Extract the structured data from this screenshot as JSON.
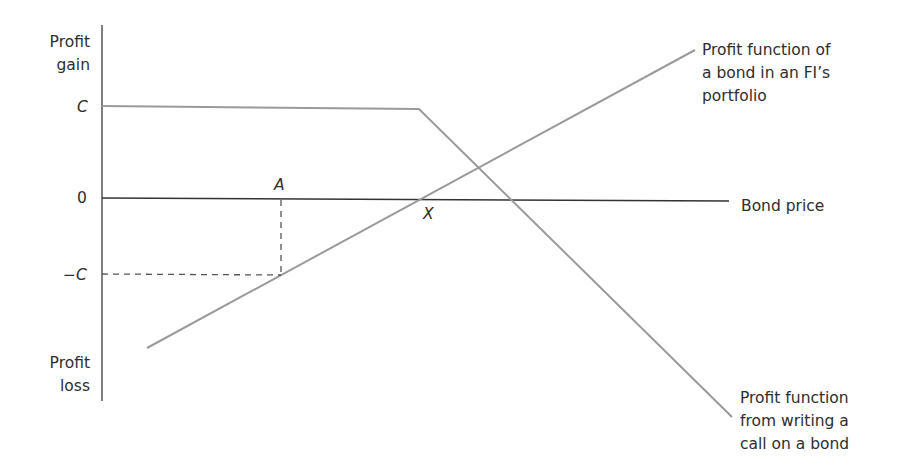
{
  "diagram": {
    "y_axis": {
      "top_label": [
        "Profit",
        "gain"
      ],
      "bottom_label": [
        "Profit",
        "loss"
      ],
      "ticks": {
        "c": "C",
        "zero": "0",
        "neg_c": "−C"
      }
    },
    "x_axis": {
      "label": "Bond price"
    },
    "points": {
      "a": "A",
      "x": "X"
    },
    "series": {
      "bond": {
        "label": [
          "Profit function of",
          "a bond in an FI’s",
          "portfolio"
        ],
        "color": "#9a9a9a"
      },
      "call": {
        "label": [
          "Profit function",
          "from writing a",
          "call on a bond"
        ],
        "color": "#9a9a9a"
      }
    },
    "colors": {
      "axis": "#444444",
      "guide": "#555555",
      "text": "#2e2e2e"
    }
  }
}
